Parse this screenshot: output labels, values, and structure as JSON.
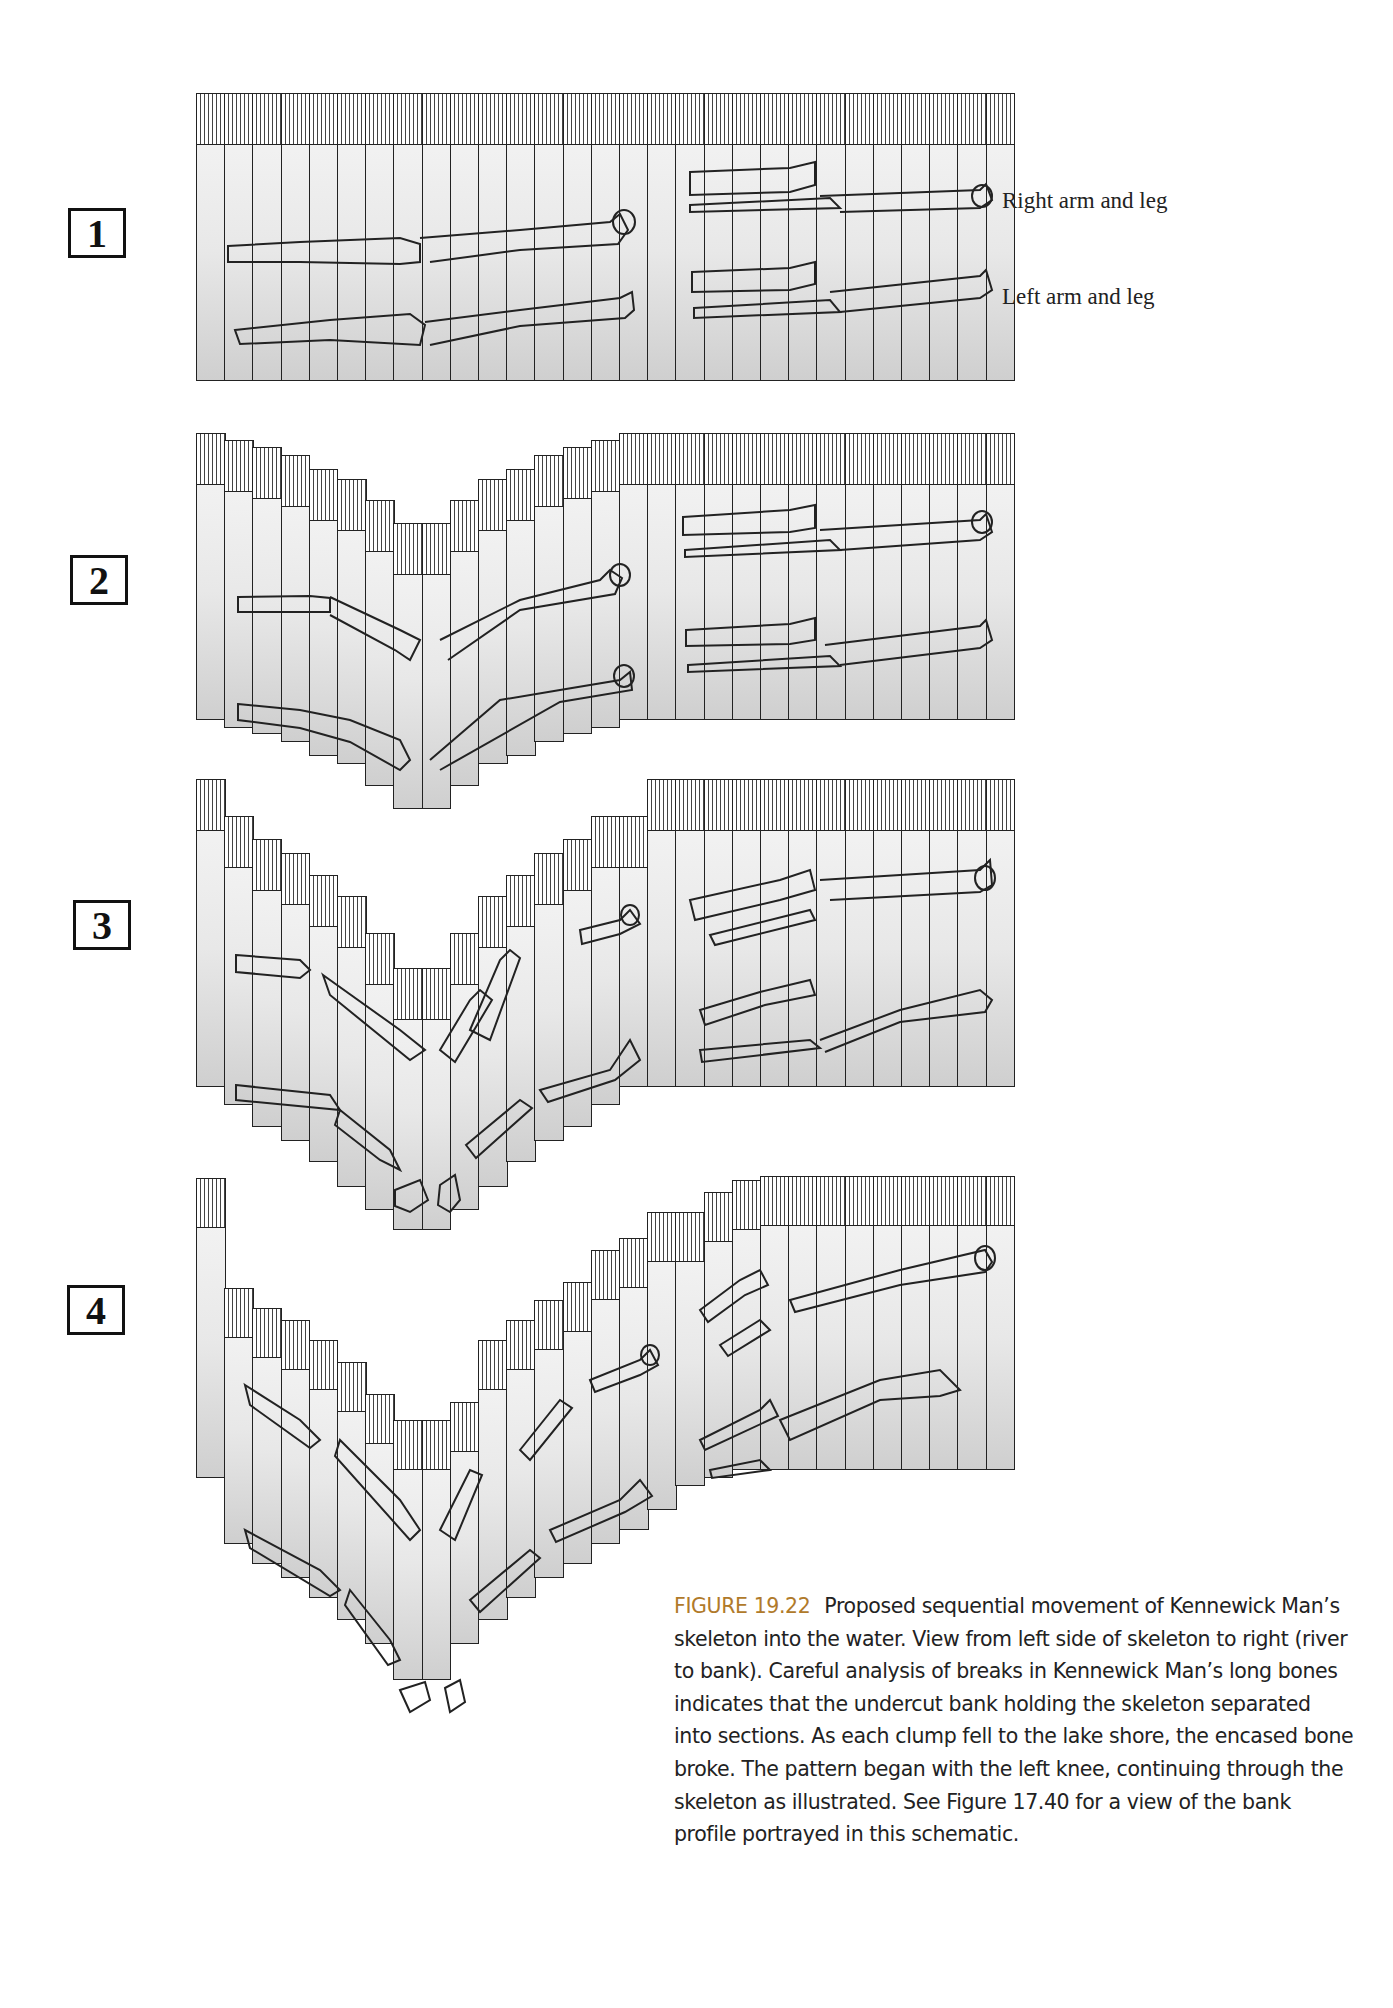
{
  "figure": {
    "label": "FIGURE 19.22",
    "caption": "Proposed sequential movement of Kennewick Man’s skeleton into the water. View from left side of skeleton to right (river to bank). Careful analysis of breaks in Kennewick Man’s long bones indicates that the undercut bank holding the skeleton separated into sections. As each clump fell to the lake shore, the encased bone broke. The pattern began with the left knee, continuing through the skeleton as illustrated. See Figure 17.40 for a view of the bank profile portrayed in this schematic.",
    "accent_color": "#b07a2a"
  },
  "limb_labels": {
    "right": "Right arm and leg",
    "left": "Left arm and leg"
  },
  "panels": [
    {
      "number": "1",
      "numbox": {
        "x": 68,
        "y": 208,
        "y_center": 232
      },
      "x0": 196,
      "col_w": 28.2,
      "ncols": 29,
      "tops": [
        93,
        93,
        93,
        93,
        93,
        93,
        93,
        93,
        93,
        93,
        93,
        93,
        93,
        93,
        93,
        93,
        93,
        93,
        93,
        93,
        93,
        93,
        93,
        93,
        93,
        93,
        93,
        93,
        93
      ],
      "bottoms": [
        381,
        381,
        381,
        381,
        381,
        381,
        381,
        381,
        381,
        381,
        381,
        381,
        381,
        381,
        381,
        381,
        381,
        381,
        381,
        381,
        381,
        381,
        381,
        381,
        381,
        381,
        381,
        381,
        381
      ],
      "hatch_h": 50
    },
    {
      "number": "2",
      "numbox": {
        "x": 70,
        "y": 555
      },
      "x0": 196,
      "col_w": 28.2,
      "ncols": 29,
      "tops": [
        433,
        440,
        447,
        455,
        469,
        479,
        500,
        523,
        523,
        500,
        479,
        469,
        455,
        447,
        440,
        433,
        433,
        433,
        433,
        433,
        433,
        433,
        433,
        433,
        433,
        433,
        433,
        433,
        433
      ],
      "bottoms": [
        720,
        728,
        734,
        742,
        756,
        764,
        786,
        809,
        809,
        786,
        764,
        756,
        742,
        734,
        728,
        720,
        720,
        720,
        720,
        720,
        720,
        720,
        720,
        720,
        720,
        720,
        720,
        720,
        720
      ],
      "hatch_h": 50
    },
    {
      "number": "3",
      "numbox": {
        "x": 73,
        "y": 900
      },
      "x0": 196,
      "col_w": 28.2,
      "ncols": 29,
      "tops": [
        779,
        816,
        839,
        853,
        875,
        896,
        933,
        968,
        968,
        933,
        896,
        875,
        853,
        839,
        816,
        816,
        779,
        779,
        779,
        779,
        779,
        779,
        779,
        779,
        779,
        779,
        779,
        779,
        779
      ],
      "bottoms": [
        1087,
        1105,
        1127,
        1141,
        1162,
        1187,
        1210,
        1230,
        1230,
        1210,
        1187,
        1162,
        1141,
        1127,
        1105,
        1087,
        1087,
        1087,
        1087,
        1087,
        1087,
        1087,
        1087,
        1087,
        1087,
        1087,
        1087,
        1087,
        1087
      ],
      "hatch_h": 50
    },
    {
      "number": "4",
      "numbox": {
        "x": 67,
        "y": 1285
      },
      "x0": 196,
      "col_w": 28.2,
      "ncols": 29,
      "tops": [
        1178,
        1288,
        1308,
        1320,
        1340,
        1362,
        1394,
        1420,
        1420,
        1402,
        1340,
        1320,
        1300,
        1282,
        1250,
        1238,
        1212,
        1212,
        1192,
        1180,
        1176,
        1176,
        1176,
        1176,
        1176,
        1176,
        1176,
        1176,
        1176
      ],
      "bottoms": [
        1478,
        1544,
        1564,
        1578,
        1598,
        1620,
        1644,
        1680,
        1680,
        1644,
        1620,
        1598,
        1578,
        1564,
        1544,
        1530,
        1510,
        1486,
        1478,
        1470,
        1470,
        1470,
        1470,
        1470,
        1470,
        1470,
        1470,
        1470,
        1470
      ],
      "hatch_h": 48
    }
  ]
}
